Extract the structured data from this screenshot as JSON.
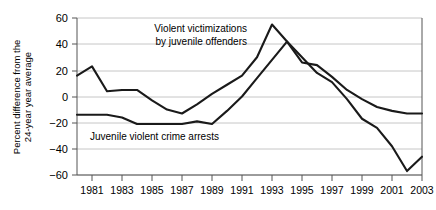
{
  "chart_data": {
    "type": "line",
    "title": "",
    "xlabel": "",
    "ylabel": "Percent difference from the 24-year year average",
    "xlim": [
      1980,
      2003
    ],
    "ylim": [
      -60,
      60
    ],
    "grid": true,
    "legend_position": "inline-annotations",
    "x": [
      1980,
      1981,
      1982,
      1983,
      1984,
      1985,
      1986,
      1987,
      1988,
      1989,
      1990,
      1991,
      1992,
      1993,
      1994,
      1995,
      1996,
      1997,
      1998,
      1999,
      2000,
      2001,
      2002,
      2003
    ],
    "y_ticks": [
      -60,
      -40,
      -20,
      0,
      20,
      40,
      60
    ],
    "y_tick_labels": [
      "−60",
      "−40",
      "−20",
      "0",
      "20",
      "40",
      "60"
    ],
    "x_ticks": [
      1981,
      1983,
      1985,
      1987,
      1989,
      1991,
      1993,
      1995,
      1997,
      1999,
      2001,
      2003
    ],
    "x_tick_labels": [
      "1981",
      "1983",
      "1985",
      "1987",
      "1989",
      "1991",
      "1993",
      "1995",
      "1997",
      "1999",
      "2001",
      "2003"
    ],
    "series": [
      {
        "name": "Violent victimizations by juvenile offenders",
        "color": "#1a1a1a",
        "values": [
          16,
          23,
          4,
          5,
          5,
          -3,
          -10,
          -13,
          -6,
          2,
          9,
          16,
          30,
          55,
          42,
          26,
          24,
          15,
          5,
          -2,
          -8,
          -11,
          -13,
          -13
        ]
      },
      {
        "name": "Juvenile violent crime arrests",
        "color": "#1a1a1a",
        "values": [
          -14,
          -14,
          -14,
          -16,
          -21,
          -21,
          -21,
          -21,
          -19,
          -21,
          -11,
          0,
          14,
          28,
          42,
          30,
          18,
          11,
          -2,
          -17,
          -24,
          -38,
          -57,
          -46
        ]
      }
    ],
    "annotations": [
      {
        "name": "victimizations-annotation",
        "line1": "Violent victimizations",
        "line2": "by juvenile offenders"
      },
      {
        "name": "arrests-annotation",
        "line1": "Juvenile violent crime arrests"
      }
    ]
  },
  "axis": {
    "y_title": "Percent difference from the 24-year year average",
    "y_title_line1": "Percent difference from the",
    "y_title_line2": "24-year year average"
  }
}
